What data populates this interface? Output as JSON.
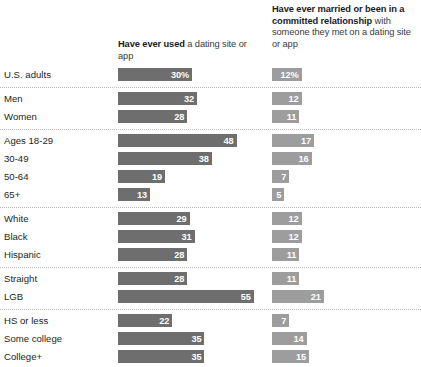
{
  "columns": [
    {
      "id": "ever-used",
      "emphasis": "Have ever used",
      "rest": " a dating site or app",
      "color": "#6e6e6e"
    },
    {
      "id": "ever-married",
      "emphasis": "Have ever married or been in a committed relationship",
      "rest": " with someone they met on a dating site or app",
      "color": "#9d9d9d"
    }
  ],
  "groups": [
    {
      "id": "all-adults",
      "rows": [
        {
          "label": "U.S. adults",
          "v1": 30,
          "v1_label": "30%",
          "v2": 12,
          "v2_label": "12%"
        }
      ]
    },
    {
      "id": "gender",
      "rows": [
        {
          "label": "Men",
          "v1": 32,
          "v1_label": "32",
          "v2": 12,
          "v2_label": "12"
        },
        {
          "label": "Women",
          "v1": 28,
          "v1_label": "28",
          "v2": 11,
          "v2_label": "11"
        }
      ]
    },
    {
      "id": "age",
      "rows": [
        {
          "label": "Ages 18-29",
          "v1": 48,
          "v1_label": "48",
          "v2": 17,
          "v2_label": "17"
        },
        {
          "label": "30-49",
          "v1": 38,
          "v1_label": "38",
          "v2": 16,
          "v2_label": "16"
        },
        {
          "label": "50-64",
          "v1": 19,
          "v1_label": "19",
          "v2": 7,
          "v2_label": "7"
        },
        {
          "label": "65+",
          "v1": 13,
          "v1_label": "13",
          "v2": 5,
          "v2_label": "5"
        }
      ]
    },
    {
      "id": "race",
      "rows": [
        {
          "label": "White",
          "v1": 29,
          "v1_label": "29",
          "v2": 12,
          "v2_label": "12"
        },
        {
          "label": "Black",
          "v1": 31,
          "v1_label": "31",
          "v2": 12,
          "v2_label": "12"
        },
        {
          "label": "Hispanic",
          "v1": 28,
          "v1_label": "28",
          "v2": 11,
          "v2_label": "11"
        }
      ]
    },
    {
      "id": "sexual-orientation",
      "rows": [
        {
          "label": "Straight",
          "v1": 28,
          "v1_label": "28",
          "v2": 11,
          "v2_label": "11"
        },
        {
          "label": "LGB",
          "v1": 55,
          "v1_label": "55",
          "v2": 21,
          "v2_label": "21"
        }
      ]
    },
    {
      "id": "education",
      "rows": [
        {
          "label": "HS or less",
          "v1": 22,
          "v1_label": "22",
          "v2": 7,
          "v2_label": "7"
        },
        {
          "label": "Some college",
          "v1": 35,
          "v1_label": "35",
          "v2": 14,
          "v2_label": "14"
        },
        {
          "label": "College+",
          "v1": 35,
          "v1_label": "35",
          "v2": 15,
          "v2_label": "15"
        }
      ]
    }
  ],
  "chart_data": {
    "type": "bar",
    "title": "",
    "subtitle": "",
    "xlabel": "",
    "ylabel": "",
    "xlim": [
      0,
      55
    ],
    "grid": false,
    "legend_position": "top",
    "orientation": "horizontal",
    "categories": [
      "U.S. adults",
      "Men",
      "Women",
      "Ages 18-29",
      "30-49",
      "50-64",
      "65+",
      "White",
      "Black",
      "Hispanic",
      "Straight",
      "LGB",
      "HS or less",
      "Some college",
      "College+"
    ],
    "series": [
      {
        "name": "Have ever used a dating site or app",
        "color": "#6e6e6e",
        "values": [
          30,
          32,
          28,
          48,
          38,
          19,
          13,
          29,
          31,
          28,
          28,
          55,
          22,
          35,
          35
        ],
        "value_labels": [
          "30%",
          "32",
          "28",
          "48",
          "38",
          "19",
          "13",
          "29",
          "31",
          "28",
          "28",
          "55",
          "22",
          "35",
          "35"
        ]
      },
      {
        "name": "Have ever married or been in a committed relationship with someone they met on a dating site or app",
        "color": "#9d9d9d",
        "values": [
          12,
          12,
          11,
          17,
          16,
          7,
          5,
          12,
          12,
          11,
          11,
          21,
          7,
          14,
          15
        ],
        "value_labels": [
          "12%",
          "12",
          "11",
          "17",
          "16",
          "7",
          "5",
          "12",
          "12",
          "11",
          "11",
          "21",
          "7",
          "14",
          "15"
        ]
      }
    ],
    "group_breaks": [
      "all-adults",
      "gender",
      "age",
      "race",
      "sexual-orientation",
      "education"
    ]
  },
  "scale": {
    "px_per_unit": 2.47
  }
}
